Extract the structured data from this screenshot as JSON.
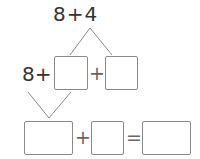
{
  "problem": {
    "top_expression": "8+4",
    "row2": {
      "prefix": "8+",
      "plus": "+"
    },
    "row3": {
      "plus": "+",
      "equals": "="
    },
    "blanks": [
      {
        "id": "row2-box-1",
        "value": ""
      },
      {
        "id": "row2-box-2",
        "value": ""
      },
      {
        "id": "row3-box-1",
        "value": ""
      },
      {
        "id": "row3-box-2",
        "value": ""
      },
      {
        "id": "row3-box-3",
        "value": ""
      }
    ]
  },
  "colors": {
    "text": "#333333",
    "box_border": "#8a8a8a",
    "lines": "#8a8a8a"
  }
}
